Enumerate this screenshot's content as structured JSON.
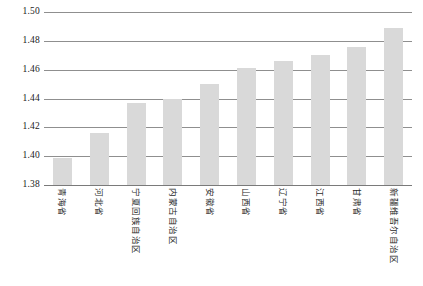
{
  "chart_data": {
    "type": "bar",
    "title": "",
    "subtitle": "",
    "xlabel": "",
    "ylabel": "",
    "ylim": [
      1.38,
      1.5
    ],
    "ytick_labels": [
      "1.50",
      "1.48",
      "1.46",
      "1.44",
      "1.42",
      "1.40",
      "1.38"
    ],
    "ytick_values": [
      1.5,
      1.48,
      1.46,
      1.44,
      1.42,
      1.4,
      1.38
    ],
    "grid": true,
    "legend": null,
    "bar_color": "#d9d9d9",
    "gridline_color": "#8f8f8f",
    "categories": [
      "青海省",
      "河北省",
      "宁夏回族自治区",
      "内蒙古自治区",
      "安徽省",
      "山西省",
      "辽宁省",
      "江西省",
      "甘肃省",
      "新疆维吾尔自治区"
    ],
    "values": [
      1.399,
      1.416,
      1.437,
      1.44,
      1.45,
      1.461,
      1.466,
      1.47,
      1.476,
      1.489
    ]
  }
}
